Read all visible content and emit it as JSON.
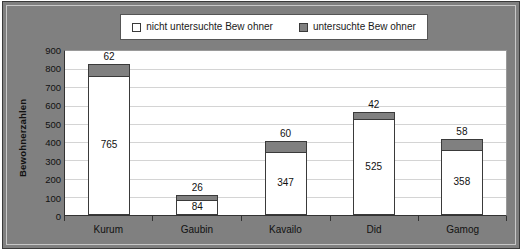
{
  "chart_data": {
    "type": "bar",
    "subtype": "stacked-bar",
    "title": "",
    "xlabel": "",
    "ylabel": "Bewohnerzahlen",
    "ylim": [
      0,
      900
    ],
    "ytick_step": 100,
    "yticks": [
      900,
      800,
      700,
      600,
      500,
      400,
      300,
      200,
      100,
      0
    ],
    "grid": true,
    "legend_position": "top",
    "categories": [
      "Kurum",
      "Gaubin",
      "Kavailo",
      "Did",
      "Gamog"
    ],
    "series": [
      {
        "name": "nicht untersuchte Bew ohner",
        "color": "#ffffff",
        "values": [
          765,
          84,
          347,
          525,
          358
        ]
      },
      {
        "name": "untersuchte Bew ohner",
        "color": "#808080",
        "values": [
          62,
          26,
          60,
          42,
          58
        ]
      }
    ],
    "totals": [
      827,
      110,
      407,
      567,
      416
    ]
  },
  "legend": {
    "items": [
      {
        "label": "nicht untersuchte Bew ohner",
        "swatch": "white-square-icon"
      },
      {
        "label": "untersuchte Bew ohner",
        "swatch": "gray-square-icon"
      }
    ]
  },
  "axes": {
    "y_title": "Bewohnerzahlen",
    "y_ticks": [
      "900",
      "800",
      "700",
      "600",
      "500",
      "400",
      "300",
      "200",
      "100",
      "0"
    ],
    "x_labels": [
      "Kurum",
      "Gaubin",
      "Kavailo",
      "Did",
      "Gamog"
    ]
  },
  "bars": [
    {
      "category": "Kurum",
      "bottom_label": "765",
      "top_label": "62"
    },
    {
      "category": "Gaubin",
      "bottom_label": "84",
      "top_label": "26"
    },
    {
      "category": "Kavailo",
      "bottom_label": "347",
      "top_label": "60"
    },
    {
      "category": "Did",
      "bottom_label": "525",
      "top_label": "42"
    },
    {
      "category": "Gamog",
      "bottom_label": "358",
      "top_label": "58"
    }
  ],
  "colors": {
    "background": "#808080",
    "plot_background": "#ffffff",
    "series_examined": "#808080",
    "series_not_examined": "#ffffff",
    "gridline": "#d4d4d4",
    "axis": "#333333"
  }
}
